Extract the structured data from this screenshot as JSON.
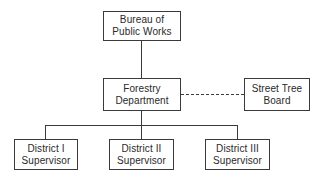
{
  "diagram": {
    "type": "organizational-chart",
    "nodes": {
      "bureau": {
        "line1": "Bureau of",
        "line2": "Public Works"
      },
      "forestry": {
        "line1": "Forestry",
        "line2": "Department"
      },
      "street_tree": {
        "line1": "Street Tree",
        "line2": "Board"
      },
      "district1": {
        "line1": "District I",
        "line2": "Supervisor"
      },
      "district2": {
        "line1": "District II",
        "line2": "Supervisor"
      },
      "district3": {
        "line1": "District III",
        "line2": "Supervisor"
      }
    },
    "edges": [
      {
        "from": "Bureau of Public Works",
        "to": "Forestry Department",
        "style": "solid"
      },
      {
        "from": "Forestry Department",
        "to": "Street Tree Board",
        "style": "dashed"
      },
      {
        "from": "Forestry Department",
        "to": "District I Supervisor",
        "style": "solid"
      },
      {
        "from": "Forestry Department",
        "to": "District II Supervisor",
        "style": "solid"
      },
      {
        "from": "Forestry Department",
        "to": "District III Supervisor",
        "style": "solid"
      }
    ]
  }
}
